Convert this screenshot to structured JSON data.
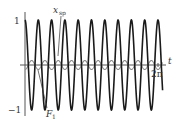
{
  "chart_data": {
    "type": "line",
    "title": "",
    "xlabel": "t",
    "ylabel": "",
    "xlim": [
      0,
      6.2832
    ],
    "ylim": [
      -1,
      1
    ],
    "grid": false,
    "x_tick_labels": [
      "2π"
    ],
    "y_tick_labels": [
      "1",
      "−1"
    ],
    "series": [
      {
        "name": "x_sp",
        "label_main": "x",
        "label_sub": "sp",
        "color": "#1a1a1a",
        "formula": "cos(10 t)",
        "amplitude": 1.0,
        "cycles_over_2pi": 10,
        "t_end": 6.5
      },
      {
        "name": "F_1",
        "label_main": "F",
        "label_sub": "1",
        "color": "#8a8a8a",
        "formula": "-0.1 cos(10 t)",
        "amplitude": 0.1,
        "cycles_over_2pi": 10,
        "t_end": 6.5
      }
    ],
    "annotations": [
      "x_sp",
      "F_1"
    ]
  },
  "labels": {
    "t": "t",
    "two_pi": "2π",
    "one": "1",
    "minus_one": "−1",
    "xsp_main": "x",
    "xsp_sub": "sp",
    "f1_main": "F",
    "f1_sub": "1"
  }
}
